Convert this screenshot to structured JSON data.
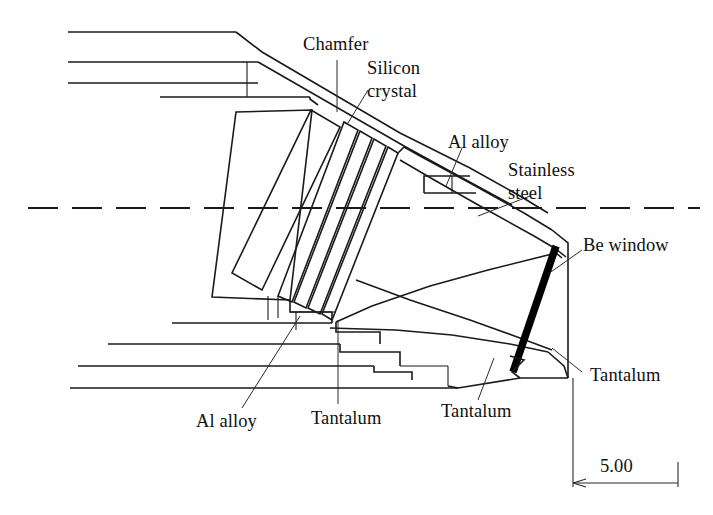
{
  "figure": {
    "kind": "engineering-cross-section",
    "background_color": "#ffffff",
    "line_color": "#1a1a1a"
  },
  "labels": {
    "chamfer": "Chamfer",
    "silicon_crystal_line1": "Silicon",
    "silicon_crystal_line2": "crystal",
    "al_alloy_top": "Al alloy",
    "stainless_line1": "Stainless",
    "stainless_line2": "steel",
    "be_window": "Be window",
    "tantalum_right": "Tantalum",
    "al_alloy_bottom": "Al alloy",
    "tantalum_bottom_center": "Tantalum",
    "tantalum_bottom_right": "Tantalum"
  },
  "dimension": {
    "value": "5.00",
    "units_shown": false
  },
  "annotation_list": [
    "Chamfer",
    "Silicon crystal",
    "Al alloy",
    "Stainless steel",
    "Be window",
    "Tantalum",
    "Al alloy",
    "Tantalum",
    "Tantalum",
    "5.00"
  ]
}
